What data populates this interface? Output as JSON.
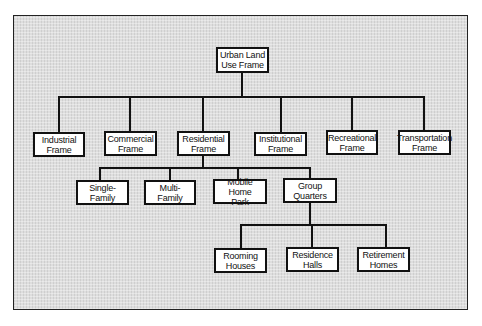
{
  "diagram": {
    "type": "hierarchy-tree",
    "root": {
      "label": "Urban Land\nUse Frame"
    },
    "level1": [
      {
        "label": "Industrial\nFrame"
      },
      {
        "label": "Commercial\nFrame"
      },
      {
        "label": "Residential\nFrame"
      },
      {
        "label": "Institutional\nFrame"
      },
      {
        "label": "Recreational\nFrame"
      },
      {
        "label": "Transportation\nFrame"
      }
    ],
    "residential_children": [
      {
        "label": "Single-\nFamily"
      },
      {
        "label": "Multi-\nFamily"
      },
      {
        "label": "Mobile Home\nPark"
      },
      {
        "label": "Group\nQuarters"
      }
    ],
    "group_quarters_children": [
      {
        "label": "Rooming\nHouses"
      },
      {
        "label": "Residence\nHalls"
      },
      {
        "label": "Retirement\nHomes"
      }
    ],
    "edges": [
      [
        "Urban Land Use Frame",
        "Industrial Frame"
      ],
      [
        "Urban Land Use Frame",
        "Commercial Frame"
      ],
      [
        "Urban Land Use Frame",
        "Residential Frame"
      ],
      [
        "Urban Land Use Frame",
        "Institutional Frame"
      ],
      [
        "Urban Land Use Frame",
        "Recreational Frame"
      ],
      [
        "Urban Land Use Frame",
        "Transportation Frame"
      ],
      [
        "Residential Frame",
        "Single-Family"
      ],
      [
        "Residential Frame",
        "Multi-Family"
      ],
      [
        "Residential Frame",
        "Mobile Home Park"
      ],
      [
        "Residential Frame",
        "Group Quarters"
      ],
      [
        "Group Quarters",
        "Rooming Houses"
      ],
      [
        "Group Quarters",
        "Residence Halls"
      ],
      [
        "Group Quarters",
        "Retirement Homes"
      ]
    ]
  }
}
